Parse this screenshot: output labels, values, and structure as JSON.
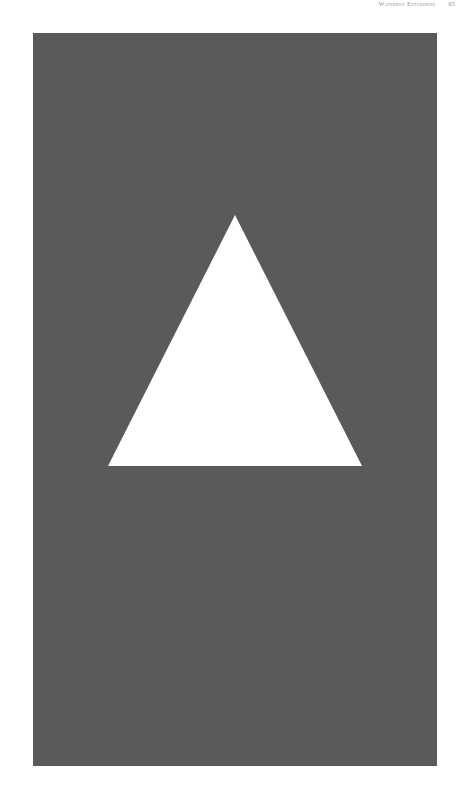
{
  "page": {
    "background_color": "#ffffff",
    "width": 471,
    "height": 799
  },
  "header": {
    "title": "Waterkop Enterprise",
    "page_number": "65",
    "text_color": "#8d8d8d"
  },
  "figure": {
    "name": "white-triangle-plate",
    "plate": {
      "background_color": "#5a5a5a",
      "left": 33,
      "top": 33,
      "width": 404,
      "height": 733
    },
    "shape": {
      "kind": "triangle",
      "fill_color": "#ffffff",
      "apex_x": 202,
      "apex_y": 182,
      "base_left_x": 75,
      "base_right_x": 329,
      "base_y": 433
    }
  }
}
